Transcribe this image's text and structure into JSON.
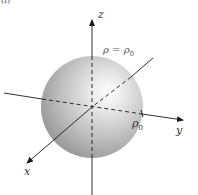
{
  "figure": {
    "panel_label": "(f)",
    "equation": {
      "lhs": "ρ",
      "op": "=",
      "rhs_symbol": "ρ",
      "rhs_subscript": "0"
    },
    "radius_label": {
      "symbol": "ρ",
      "subscript": "0"
    },
    "axes": {
      "x": "x",
      "y": "y",
      "z": "z"
    },
    "colors": {
      "sphere_highlight": "#ffffff",
      "sphere_mid": "#c8c8c8",
      "sphere_shadow": "#8e8e8e",
      "axis": "#1a1a1a"
    },
    "shape": "sphere"
  }
}
